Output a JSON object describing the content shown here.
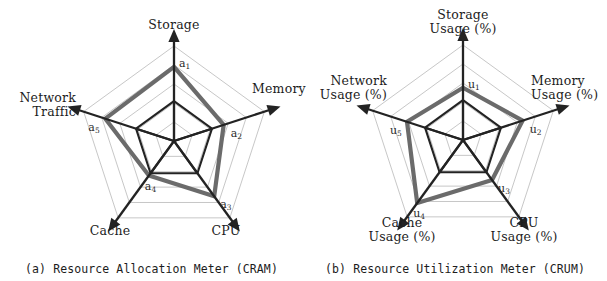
{
  "figure": {
    "background": "#ffffff",
    "ink_color": "#232323",
    "grid_color": "#a8a8a8",
    "series_color": "#6b6b6b"
  },
  "panels": [
    {
      "id": "a",
      "caption": "(a) Resource Allocation Meter (CRAM)",
      "center": {
        "x": 174,
        "y": 141
      },
      "max_radius": 95,
      "axis_labels": [
        {
          "text": "Storage",
          "lines": [
            "Storage"
          ]
        },
        {
          "text": "Memory",
          "lines": [
            "Memory"
          ]
        },
        {
          "text": "CPU",
          "lines": [
            "CPU"
          ]
        },
        {
          "text": "Cache",
          "lines": [
            "Cache"
          ]
        },
        {
          "text": "Network Traffic",
          "lines": [
            "Network",
            "Traffic"
          ]
        }
      ],
      "vertex_labels": [
        "a1",
        "a2",
        "a3",
        "a4",
        "a5"
      ],
      "vertex_labels_display": [
        {
          "base": "a",
          "sub": "1"
        },
        {
          "base": "a",
          "sub": "2"
        },
        {
          "base": "a",
          "sub": "3"
        },
        {
          "base": "a",
          "sub": "4"
        },
        {
          "base": "a",
          "sub": "5"
        }
      ]
    },
    {
      "id": "b",
      "caption": "(b) Resource Utilization Meter (CRUM)",
      "center": {
        "x": 160,
        "y": 140
      },
      "max_radius": 95,
      "axis_labels": [
        {
          "text": "Storage Usage (%)",
          "lines": [
            "Storage",
            "Usage (%)"
          ]
        },
        {
          "text": "Memory Usage (%)",
          "lines": [
            "Memory",
            "Usage (%)"
          ]
        },
        {
          "text": "CPU Usage (%)",
          "lines": [
            "CPU",
            "Usage (%)"
          ]
        },
        {
          "text": "Cache Usage (%)",
          "lines": [
            "Cache",
            "Usage (%)"
          ]
        },
        {
          "text": "Network Usage (%)",
          "lines": [
            "Network",
            "Usage (%)"
          ]
        }
      ],
      "vertex_labels": [
        "u1",
        "u2",
        "u3",
        "u4",
        "u5"
      ],
      "vertex_labels_display": [
        {
          "base": "u",
          "sub": "1"
        },
        {
          "base": "u",
          "sub": "2"
        },
        {
          "base": "u",
          "sub": "3"
        },
        {
          "base": "u",
          "sub": "4"
        },
        {
          "base": "u",
          "sub": "5"
        }
      ]
    }
  ],
  "chart_data": [
    {
      "type": "radar",
      "title": "(a) Resource Allocation Meter (CRAM)",
      "categories": [
        "Storage",
        "Memory",
        "CPU",
        "Cache",
        "Network Traffic"
      ],
      "point_labels": [
        "a1",
        "a2",
        "a3",
        "a4",
        "a5"
      ],
      "series": [
        {
          "name": "CRAM allocation",
          "values": [
            0.78,
            0.55,
            0.72,
            0.45,
            0.76
          ]
        }
      ],
      "rlim": [
        0,
        1
      ],
      "rings": 5,
      "grid": true,
      "legend": "none",
      "xlabel": "",
      "ylabel": ""
    },
    {
      "type": "radar",
      "title": "(b) Resource Utilization Meter (CRUM)",
      "categories": [
        "Storage Usage (%)",
        "Memory Usage (%)",
        "CPU Usage (%)",
        "Cache Usage (%)",
        "Network Usage (%)"
      ],
      "point_labels": [
        "u1",
        "u2",
        "u3",
        "u4",
        "u5"
      ],
      "series": [
        {
          "name": "CRUM utilization",
          "values": [
            0.55,
            0.66,
            0.52,
            0.82,
            0.62
          ]
        }
      ],
      "rlim": [
        0,
        1
      ],
      "rings": 5,
      "grid": true,
      "legend": "none",
      "xlabel": "",
      "ylabel": ""
    }
  ]
}
